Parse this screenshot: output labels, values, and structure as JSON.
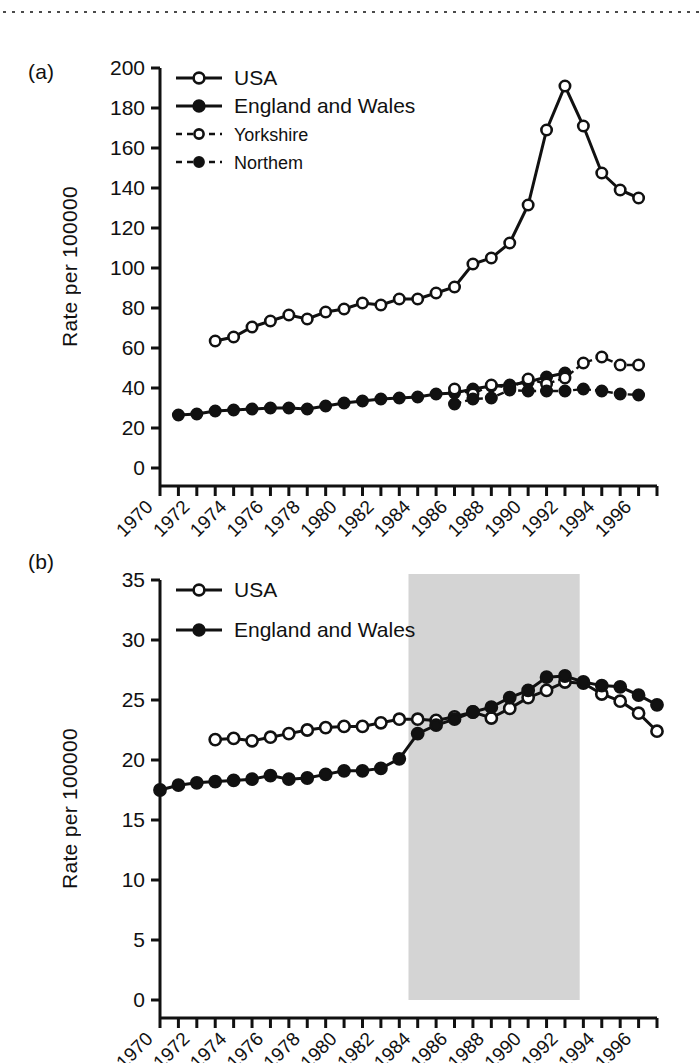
{
  "figure": {
    "top_rule": "dotted-divider"
  },
  "panels": [
    {
      "label": "(a)",
      "ylabel": "Rate per 100000",
      "legend": [
        {
          "label": "USA",
          "marker": "open-circle",
          "line": "solid"
        },
        {
          "label": "England and Wales",
          "marker": "filled-circle",
          "line": "solid"
        },
        {
          "label": "Yorkshire",
          "marker": "open-circle",
          "line": "dashed"
        },
        {
          "label": "Northem",
          "marker": "filled-circle",
          "line": "dashed"
        }
      ]
    },
    {
      "label": "(b)",
      "ylabel": "Rate per 100000",
      "legend": [
        {
          "label": "USA",
          "marker": "open-circle",
          "line": "solid"
        },
        {
          "label": "England and Wales",
          "marker": "filled-circle",
          "line": "solid"
        }
      ]
    }
  ],
  "chart_data": [
    {
      "panel": "(a)",
      "type": "line",
      "title": "",
      "xlabel": "",
      "ylabel": "Rate per 100000",
      "xlim": [
        1970,
        1997
      ],
      "ylim": [
        0,
        200
      ],
      "yticks": [
        0,
        20,
        40,
        60,
        80,
        100,
        120,
        140,
        160,
        180,
        200
      ],
      "xticks": [
        1970,
        1971,
        1972,
        1973,
        1974,
        1975,
        1976,
        1977,
        1978,
        1979,
        1980,
        1981,
        1982,
        1983,
        1984,
        1985,
        1986,
        1987,
        1988,
        1989,
        1990,
        1991,
        1992,
        1993,
        1994,
        1995,
        1996,
        1997
      ],
      "xtick_labels": [
        "1970",
        "1972",
        "1974",
        "1976",
        "1978",
        "1980",
        "1982",
        "1984",
        "1986",
        "1988",
        "1990",
        "1992",
        "1994",
        "1996"
      ],
      "grid": false,
      "legend_position": "top-left",
      "series": [
        {
          "name": "USA",
          "marker": "open-circle",
          "line": "solid",
          "x": [
            1973,
            1974,
            1975,
            1976,
            1977,
            1978,
            1979,
            1980,
            1981,
            1982,
            1983,
            1984,
            1985,
            1986,
            1987,
            1988,
            1989,
            1990,
            1991,
            1992,
            1993,
            1994,
            1995,
            1996
          ],
          "values": [
            63.5,
            65.5,
            70.5,
            73.5,
            76.5,
            74.5,
            78.0,
            79.5,
            82.5,
            81.5,
            84.5,
            84.5,
            87.5,
            90.5,
            102.0,
            105.0,
            112.5,
            131.5,
            169.0,
            191.0,
            171.0,
            147.5,
            139.0,
            135.0
          ]
        },
        {
          "name": "England and Wales",
          "marker": "filled-circle",
          "line": "solid",
          "x": [
            1971,
            1972,
            1973,
            1974,
            1975,
            1976,
            1977,
            1978,
            1979,
            1980,
            1981,
            1982,
            1983,
            1984,
            1985,
            1986,
            1987,
            1988,
            1989,
            1990,
            1991,
            1992
          ],
          "values": [
            26.5,
            27.0,
            28.5,
            29.0,
            29.5,
            30.0,
            30.0,
            29.5,
            31.0,
            32.5,
            33.5,
            34.5,
            35.0,
            35.5,
            37.0,
            37.5,
            39.5,
            41.0,
            41.5,
            43.0,
            45.5,
            47.5
          ]
        },
        {
          "name": "Yorkshire",
          "marker": "open-circle",
          "line": "dashed",
          "x": [
            1986,
            1987,
            1988,
            1989,
            1990,
            1991,
            1992,
            1993,
            1994,
            1995,
            1996
          ],
          "values": [
            39.5,
            37.0,
            41.5,
            40.0,
            44.5,
            42.0,
            45.0,
            52.5,
            55.5,
            51.5,
            51.5
          ]
        },
        {
          "name": "Northem",
          "marker": "filled-circle",
          "line": "dashed",
          "x": [
            1986,
            1987,
            1988,
            1989,
            1990,
            1991,
            1992,
            1993,
            1994,
            1995,
            1996
          ],
          "values": [
            32.0,
            34.5,
            35.0,
            39.0,
            38.5,
            38.5,
            38.5,
            39.5,
            38.5,
            37.0,
            36.5
          ]
        }
      ]
    },
    {
      "panel": "(b)",
      "type": "line",
      "title": "",
      "xlabel": "",
      "ylabel": "Rate per 100000",
      "xlim": [
        1970,
        1997
      ],
      "ylim": [
        0,
        35
      ],
      "yticks": [
        0,
        5,
        10,
        15,
        20,
        25,
        30,
        35
      ],
      "xticks": [
        1970,
        1971,
        1972,
        1973,
        1974,
        1975,
        1976,
        1977,
        1978,
        1979,
        1980,
        1981,
        1982,
        1983,
        1984,
        1985,
        1986,
        1987,
        1988,
        1989,
        1990,
        1991,
        1992,
        1993,
        1994,
        1995,
        1996,
        1997
      ],
      "xtick_labels": [
        "1970",
        "1972",
        "1974",
        "1976",
        "1978",
        "1980",
        "1982",
        "1984",
        "1986",
        "1988",
        "1990",
        "1992",
        "1994",
        "1996"
      ],
      "grid": false,
      "legend_position": "top-left",
      "shaded_band": {
        "x_start": 1983.5,
        "x_end": 1992.8,
        "color": "#d4d4d4"
      },
      "series": [
        {
          "name": "USA",
          "marker": "open-circle",
          "line": "solid",
          "x": [
            1973,
            1974,
            1975,
            1976,
            1977,
            1978,
            1979,
            1980,
            1981,
            1982,
            1983,
            1984,
            1985,
            1986,
            1987,
            1988,
            1989,
            1990,
            1991,
            1992,
            1993,
            1994,
            1995,
            1996,
            1997
          ],
          "values": [
            21.7,
            21.8,
            21.6,
            21.9,
            22.2,
            22.5,
            22.7,
            22.8,
            22.8,
            23.1,
            23.4,
            23.4,
            23.3,
            23.6,
            24.0,
            23.5,
            24.3,
            25.2,
            25.8,
            26.5,
            26.4,
            25.5,
            24.9,
            23.9,
            22.4
          ]
        },
        {
          "name": "England and Wales",
          "marker": "filled-circle",
          "line": "solid",
          "x": [
            1970,
            1971,
            1972,
            1973,
            1974,
            1975,
            1976,
            1977,
            1978,
            1979,
            1980,
            1981,
            1982,
            1983,
            1984,
            1985,
            1986,
            1987,
            1988,
            1989,
            1990,
            1991,
            1992,
            1993,
            1994,
            1995,
            1996,
            1997
          ],
          "values": [
            17.5,
            17.9,
            18.1,
            18.2,
            18.3,
            18.4,
            18.7,
            18.4,
            18.5,
            18.8,
            19.1,
            19.1,
            19.3,
            20.1,
            22.2,
            22.9,
            23.4,
            24.0,
            24.4,
            25.2,
            25.8,
            26.9,
            27.0,
            26.5,
            26.2,
            26.1,
            25.4,
            24.6
          ]
        }
      ]
    }
  ]
}
